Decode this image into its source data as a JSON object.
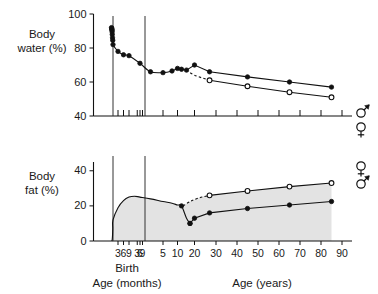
{
  "figure": {
    "width": 378,
    "height": 294,
    "background": "#ffffff",
    "line_color": "#111111",
    "fill_color": "#e3e3e3"
  },
  "panels": {
    "top": {
      "ylabel_line1": "Body",
      "ylabel_line2": "water (%)",
      "yticks": [
        "100",
        "80",
        "60",
        "40"
      ],
      "legend": {
        "male": "♂",
        "female": "♀"
      }
    },
    "bottom": {
      "ylabel_line1": "Body",
      "ylabel_line2": "fat (%)",
      "yticks": [
        "40",
        "20",
        "0"
      ],
      "legend": {
        "female": "♀",
        "male": "♂"
      }
    }
  },
  "xaxis": {
    "label_months": "Age (months)",
    "label_years": "Age (years)",
    "birth_label": "Birth",
    "month_ticks": [
      "3",
      "6",
      "9",
      "3",
      "6",
      "9"
    ],
    "year_ticks": [
      "5",
      "10",
      "20",
      "30",
      "40",
      "50",
      "60",
      "70",
      "80",
      "90"
    ]
  },
  "chart_data": {
    "type": "line",
    "xlabel": "Age (months / years)",
    "panels": [
      {
        "name": "body-water",
        "ylabel": "Body water (%)",
        "ylim": [
          40,
          100
        ],
        "yticks": [
          40,
          60,
          80,
          100
        ],
        "grid": false,
        "series": [
          {
            "name": "prenatal-infant-child (combined)",
            "marker": "filled-circle",
            "linestyle": "solid",
            "x_labels": [
              "-6mo",
              "-5mo",
              "-4.5mo",
              "-4mo",
              "-3.5mo",
              "-3mo",
              "-2mo",
              "-1mo",
              "birth",
              "3mo",
              "6mo",
              "9mo",
              "1.5y",
              "3y",
              "5y",
              "8y",
              "10y",
              "12y",
              "15y"
            ],
            "values": [
              92,
              91.5,
              91,
              90.5,
              89.5,
              88,
              86,
              84.5,
              82,
              78,
              76,
              75.5,
              71,
              66,
              65.5,
              66.5,
              68,
              67.5,
              67
            ]
          },
          {
            "name": "male",
            "marker": "filled-circle",
            "linestyle": "solid",
            "x_years": [
              20,
              27,
              45,
              65,
              85
            ],
            "values": [
              70,
              66,
              63,
              60,
              57
            ]
          },
          {
            "name": "female",
            "marker": "open-circle",
            "linestyle": "solid",
            "x_years": [
              27,
              45,
              65,
              85
            ],
            "values": [
              61,
              57.5,
              54,
              51
            ]
          },
          {
            "name": "female-branch",
            "marker": "none",
            "linestyle": "dashed",
            "x_years": [
              15,
              20,
              27
            ],
            "values": [
              67,
              64,
              61
            ]
          }
        ]
      },
      {
        "name": "body-fat",
        "ylabel": "Body fat (%)",
        "ylim": [
          0,
          45
        ],
        "yticks": [
          0,
          20,
          40
        ],
        "grid": false,
        "shaded_area": true,
        "series": [
          {
            "name": "prenatal-infant-child (combined)",
            "marker": "filled-circle",
            "linestyle": "solid",
            "x_labels": [
              "-5mo",
              "-4mo",
              "-3mo",
              "-2mo",
              "-1mo",
              "birth",
              "3mo",
              "6mo",
              "9mo",
              "1y",
              "1.5y",
              "3y",
              "5y",
              "8y",
              "10y",
              "12y",
              "15y",
              "17y"
            ],
            "values": [
              0,
              0.3,
              1,
              3,
              7,
              12,
              19,
              23,
              25,
              25.5,
              25,
              24,
              22.5,
              21.5,
              20.5,
              20,
              13,
              10
            ]
          },
          {
            "name": "male",
            "marker": "filled-circle",
            "linestyle": "solid",
            "x_years": [
              17,
              20,
              27,
              45,
              65,
              85
            ],
            "values": [
              10,
              13,
              16,
              18.5,
              20.5,
              22.5
            ]
          },
          {
            "name": "female",
            "marker": "open-circle",
            "linestyle": "solid",
            "x_years": [
              27,
              45,
              65,
              85
            ],
            "values": [
              26,
              28.5,
              31,
              33
            ]
          },
          {
            "name": "female-branch",
            "marker": "none",
            "linestyle": "dashed",
            "x_years": [
              13,
              17,
              22,
              27
            ],
            "values": [
              20,
              22.5,
              24.5,
              26
            ]
          }
        ]
      }
    ]
  }
}
